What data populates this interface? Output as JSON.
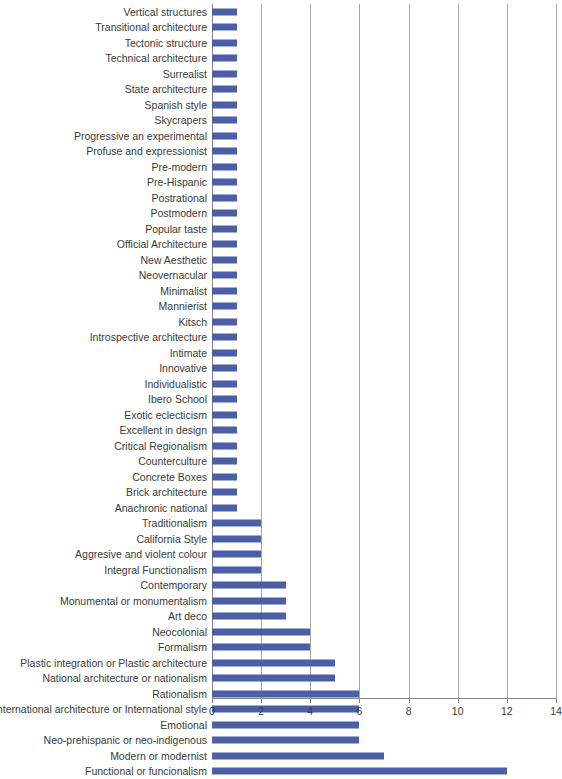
{
  "chart_data": {
    "type": "bar",
    "orientation": "horizontal",
    "title": "",
    "xlabel": "",
    "ylabel": "",
    "xlim": [
      0,
      14
    ],
    "xticks": [
      0,
      2,
      4,
      6,
      8,
      10,
      12,
      14
    ],
    "grid": true,
    "legend": false,
    "series_color": "#4A5FA5",
    "axis_color": "#868686",
    "gridline_color": "#a6a6a6",
    "categories": [
      "Vertical structures",
      "Transitional architecture",
      "Tectonic structure",
      "Technical architecture",
      "Surrealist",
      "State architecture",
      "Spanish style",
      "Skycrapers",
      "Progressive an experimental",
      "Profuse and expressionist",
      "Pre-modern",
      "Pre-Hispanic",
      "Postrational",
      "Postmodern",
      "Popular taste",
      "Official Architecture",
      "New Aesthetic",
      "Neovernacular",
      "Minimalist",
      "Mannierist",
      "Kitsch",
      "Introspective architecture",
      "Intimate",
      "Innovative",
      "Individualistic",
      "Ibero School",
      "Exotic eclecticism",
      "Excellent in design",
      "Critical Regionalism",
      "Counterculture",
      "Concrete Boxes",
      "Brick architecture",
      "Anachronic national",
      "Traditionalism",
      "California Style",
      "Aggresive and violent colour",
      "Integral Functionalism",
      "Contemporary",
      "Monumental or monumentalism",
      "Art deco",
      "Neocolonial",
      "Formalism",
      "Plastic integration or Plastic architecture",
      "National architecture or nationalism",
      "Rationalism",
      "International architecture or International style",
      "Emotional",
      "Neo-prehispanic or neo-indigenous",
      "Modern or modernist",
      "Functional or funcionalism"
    ],
    "values": [
      1,
      1,
      1,
      1,
      1,
      1,
      1,
      1,
      1,
      1,
      1,
      1,
      1,
      1,
      1,
      1,
      1,
      1,
      1,
      1,
      1,
      1,
      1,
      1,
      1,
      1,
      1,
      1,
      1,
      1,
      1,
      1,
      1,
      2,
      2,
      2,
      2,
      3,
      3,
      3,
      4,
      4,
      5,
      5,
      6,
      6,
      6,
      6,
      7,
      12
    ]
  }
}
